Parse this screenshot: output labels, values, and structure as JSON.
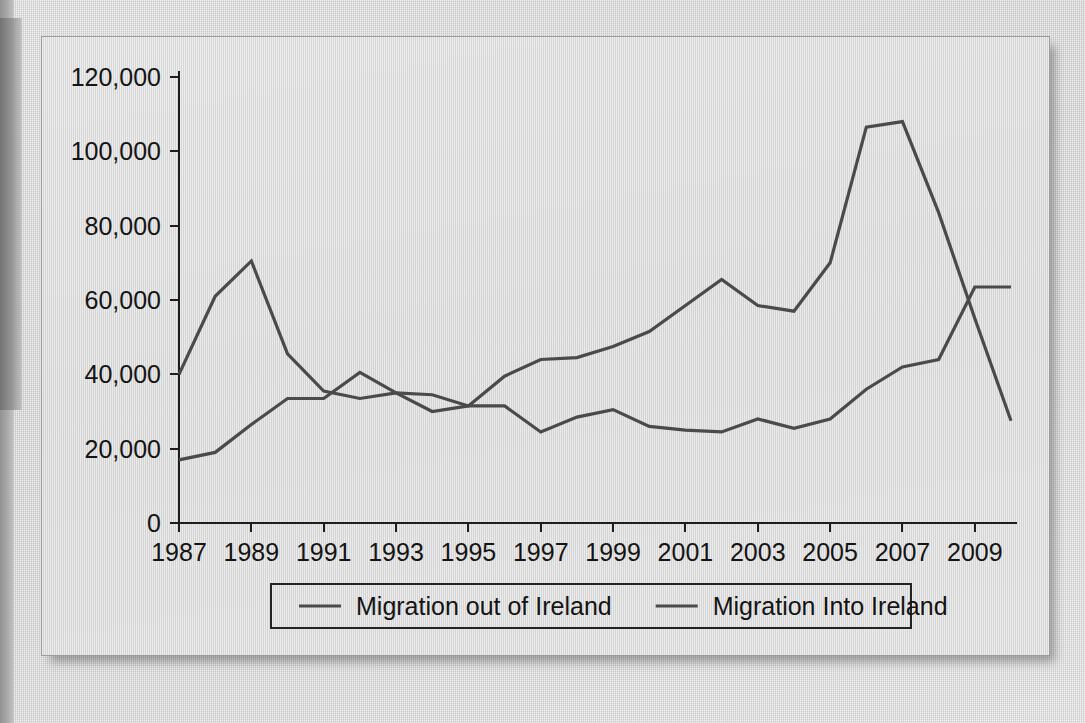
{
  "figure": {
    "panel_label": "migration-line-chart",
    "background_color": "#d8d8d8",
    "line_color": "#4a4a4a",
    "text_color": "#141414"
  },
  "chart_data": {
    "type": "line",
    "title": "",
    "subtitle": "",
    "xlabel": "",
    "ylabel": "",
    "grid": false,
    "legend_position": "bottom",
    "xlim": [
      1987,
      2010
    ],
    "ylim": [
      0,
      120000
    ],
    "x": [
      1987,
      1988,
      1989,
      1990,
      1991,
      1992,
      1993,
      1994,
      1995,
      1996,
      1997,
      1998,
      1999,
      2000,
      2001,
      2002,
      2003,
      2004,
      2005,
      2006,
      2007,
      2008,
      2009,
      2010
    ],
    "xticks": [
      1987,
      1989,
      1991,
      1993,
      1995,
      1997,
      1999,
      2001,
      2003,
      2005,
      2007,
      2009
    ],
    "xticklabels": [
      "1987",
      "1989",
      "1991",
      "1993",
      "1995",
      "1997",
      "1999",
      "2001",
      "2003",
      "2005",
      "2007",
      "2009"
    ],
    "yticks": [
      0,
      20000,
      40000,
      60000,
      80000,
      100000,
      120000
    ],
    "yticklabels": [
      "0",
      "20,000",
      "40,000",
      "60,000",
      "80,000",
      "100,000",
      "120,000"
    ],
    "series": [
      {
        "name": "Migration out of Ireland",
        "color": "#4a4a4a",
        "values": [
          40000,
          61000,
          70500,
          45500,
          35500,
          33500,
          35000,
          34500,
          31500,
          31500,
          24500,
          28500,
          30500,
          26000,
          25000,
          24500,
          28000,
          25500,
          28000,
          36000,
          42000,
          44000,
          63500,
          63500
        ]
      },
      {
        "name": "Migration Into Ireland",
        "color": "#4a4a4a",
        "values": [
          17000,
          19000,
          26500,
          33500,
          33500,
          40500,
          35000,
          30000,
          31500,
          39500,
          44000,
          44500,
          47500,
          51500,
          58500,
          65500,
          58500,
          57000,
          70000,
          106500,
          108000,
          83500,
          55000,
          27500
        ]
      }
    ]
  },
  "legend": {
    "entries": [
      {
        "label": "Migration out of Ireland",
        "swatch": "line-swatch"
      },
      {
        "label": "Migration Into Ireland",
        "swatch": "line-swatch"
      }
    ]
  }
}
